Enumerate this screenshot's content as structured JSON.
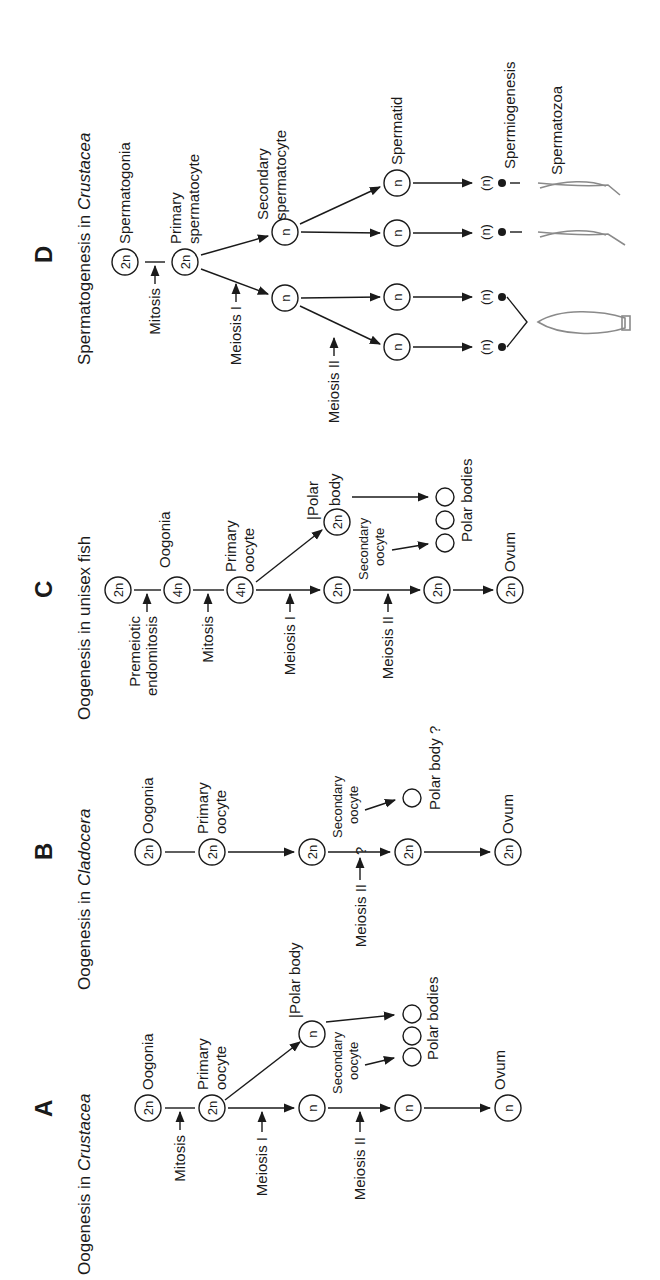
{
  "panels": {
    "A": {
      "letter": "A",
      "title_prefix": "Oogenesis in ",
      "title_italic": "Crustacea",
      "stages": {
        "oogonia": {
          "ploidy": "2n",
          "label": "Oogonia"
        },
        "primary": {
          "ploidy": "2n",
          "label_1": "Primary",
          "label_2": "oocyte"
        },
        "after_meiosis1": {
          "ploidy": "n"
        },
        "polar_body": {
          "ploidy": "n",
          "label": "|Polar body"
        },
        "secondary": {
          "label_1": "Secondary",
          "label_2": "oocyte"
        },
        "after_meiosis2": {
          "ploidy": "n"
        },
        "polar_bodies_label": "Polar bodies",
        "ovum": {
          "ploidy": "n",
          "label": "Ovum"
        }
      },
      "processes": {
        "mitosis": "Mitosis",
        "meiosis1": "Meiosis I",
        "meiosis2": "Meiosis II"
      }
    },
    "B": {
      "letter": "B",
      "title_prefix": "Oogenesis in ",
      "title_italic": "Cladocera",
      "stages": {
        "oogonia": {
          "ploidy": "2n",
          "label": "Oogonia"
        },
        "primary": {
          "ploidy": "2n",
          "label_1": "Primary",
          "label_2": "oocyte"
        },
        "middle": {
          "ploidy": "2n"
        },
        "secondary": {
          "label_1": "Secondary",
          "label_2": "oocyte"
        },
        "after_meiosis2": {
          "ploidy": "2n"
        },
        "polar_body_label": "Polar body ?",
        "ovum": {
          "ploidy": "2n",
          "label": "Ovum"
        }
      },
      "processes": {
        "meiosis2": "Meiosis II",
        "question": "?"
      }
    },
    "C": {
      "letter": "C",
      "title": "Oogenesis in unisex fish",
      "stages": {
        "start": {
          "ploidy": "2n"
        },
        "oogonia": {
          "ploidy": "4n",
          "label": "Oogonia"
        },
        "primary": {
          "ploidy": "4n",
          "label_1": "Primary",
          "label_2": "oocyte"
        },
        "after_meiosis1": {
          "ploidy": "2n"
        },
        "polar_body": {
          "ploidy": "2n",
          "label_1": "|Polar",
          "label_2": "body"
        },
        "secondary": {
          "label_1": "Secondary",
          "label_2": "oocyte"
        },
        "after_meiosis2": {
          "ploidy": "2n"
        },
        "polar_bodies_label": "Polar bodies",
        "ovum": {
          "ploidy": "2n",
          "label": "Ovum"
        }
      },
      "processes": {
        "premeiotic_1": "Premeiotic",
        "premeiotic_2": "endomitosis",
        "mitosis": "Mitosis",
        "meiosis1": "Meiosis I",
        "meiosis2": "Meiosis II"
      }
    },
    "D": {
      "letter": "D",
      "title_prefix": "Spermatogenesis in ",
      "title_italic": "Crustacea",
      "stages": {
        "spermatogonia": {
          "ploidy": "2n",
          "label": "Spermatogonia"
        },
        "primary": {
          "ploidy": "2n",
          "label_1": "Primary",
          "label_2": "spermatocyte"
        },
        "secondary": {
          "ploidy": "n",
          "label_1": "Secondary",
          "label_2": "spermatocyte"
        },
        "spermatid": {
          "ploidy": "n",
          "label": "Spermatid"
        },
        "nucleus": "(n)",
        "spermiogenesis": "Spermiogenesis",
        "spermatozoa": "Spermatozoa"
      },
      "processes": {
        "mitosis": "Mitosis",
        "meiosis1": "Meiosis I",
        "meiosis2": "Meiosis II"
      }
    }
  }
}
